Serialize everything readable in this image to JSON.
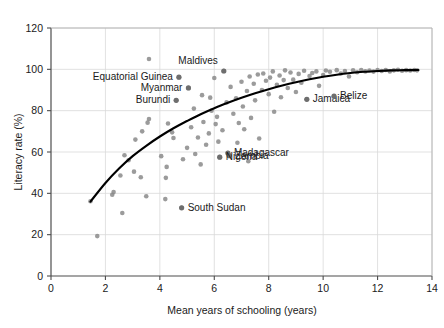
{
  "chart_data": {
    "type": "scatter",
    "title": "",
    "xlabel": "Mean years of schooling (years)",
    "ylabel": "Literacy rate (%)",
    "xlim": [
      0,
      14
    ],
    "ylim": [
      0,
      120
    ],
    "xticks": [
      0,
      2,
      4,
      6,
      8,
      10,
      12,
      14
    ],
    "yticks": [
      0,
      20,
      40,
      60,
      80,
      100,
      120
    ],
    "grid": true,
    "legend": "none",
    "marker_color": "#8a8a8a",
    "trendline_color": "#000000",
    "trendline_note": "Saturating logarithmic fit rising from ~36% at 1.5 years to ~100% at 13.5 years",
    "points": [
      {
        "x": 1.45,
        "y": 36.2
      },
      {
        "x": 1.7,
        "y": 19.3
      },
      {
        "x": 2.25,
        "y": 39.3
      },
      {
        "x": 2.3,
        "y": 40.6
      },
      {
        "x": 2.55,
        "y": 48.6
      },
      {
        "x": 2.62,
        "y": 30.5
      },
      {
        "x": 2.7,
        "y": 58.4
      },
      {
        "x": 2.85,
        "y": 56.0
      },
      {
        "x": 3.05,
        "y": 50.5
      },
      {
        "x": 3.1,
        "y": 66.0
      },
      {
        "x": 3.3,
        "y": 47.8
      },
      {
        "x": 3.35,
        "y": 70.0
      },
      {
        "x": 3.5,
        "y": 38.6
      },
      {
        "x": 3.55,
        "y": 74.2
      },
      {
        "x": 3.6,
        "y": 76.0
      },
      {
        "x": 4.05,
        "y": 58.0
      },
      {
        "x": 4.2,
        "y": 37.2
      },
      {
        "x": 4.22,
        "y": 47.5
      },
      {
        "x": 4.25,
        "y": 52.8
      },
      {
        "x": 4.3,
        "y": 73.8
      },
      {
        "x": 4.45,
        "y": 69.5
      },
      {
        "x": 4.5,
        "y": 66.8
      },
      {
        "x": 4.6,
        "y": 85.0
      },
      {
        "x": 4.7,
        "y": 96.2
      },
      {
        "x": 4.8,
        "y": 33.0
      },
      {
        "x": 4.85,
        "y": 56.5
      },
      {
        "x": 5.0,
        "y": 62.0
      },
      {
        "x": 5.05,
        "y": 91.0
      },
      {
        "x": 5.15,
        "y": 72.0
      },
      {
        "x": 5.25,
        "y": 81.0
      },
      {
        "x": 5.3,
        "y": 59.0
      },
      {
        "x": 5.4,
        "y": 67.0
      },
      {
        "x": 5.5,
        "y": 54.0
      },
      {
        "x": 5.55,
        "y": 87.5
      },
      {
        "x": 5.6,
        "y": 74.5
      },
      {
        "x": 5.7,
        "y": 63.5
      },
      {
        "x": 5.8,
        "y": 69.0
      },
      {
        "x": 5.85,
        "y": 86.3
      },
      {
        "x": 5.9,
        "y": 80.0
      },
      {
        "x": 6.0,
        "y": 95.8
      },
      {
        "x": 6.05,
        "y": 73.5
      },
      {
        "x": 6.1,
        "y": 77.0
      },
      {
        "x": 6.15,
        "y": 65.0
      },
      {
        "x": 6.2,
        "y": 57.5
      },
      {
        "x": 6.3,
        "y": 70.5
      },
      {
        "x": 6.35,
        "y": 99.2
      },
      {
        "x": 6.45,
        "y": 84.0
      },
      {
        "x": 6.5,
        "y": 59.5
      },
      {
        "x": 6.55,
        "y": 58.2
      },
      {
        "x": 6.6,
        "y": 91.5
      },
      {
        "x": 6.7,
        "y": 78.5
      },
      {
        "x": 6.8,
        "y": 86.0
      },
      {
        "x": 6.85,
        "y": 64.5
      },
      {
        "x": 6.9,
        "y": 74.0
      },
      {
        "x": 7.0,
        "y": 94.0
      },
      {
        "x": 7.05,
        "y": 82.0
      },
      {
        "x": 7.1,
        "y": 71.0
      },
      {
        "x": 7.2,
        "y": 89.5
      },
      {
        "x": 7.25,
        "y": 55.5
      },
      {
        "x": 7.3,
        "y": 96.5
      },
      {
        "x": 7.35,
        "y": 76.5
      },
      {
        "x": 7.45,
        "y": 93.0
      },
      {
        "x": 7.5,
        "y": 85.0
      },
      {
        "x": 7.6,
        "y": 97.5
      },
      {
        "x": 7.65,
        "y": 66.5
      },
      {
        "x": 7.75,
        "y": 90.0
      },
      {
        "x": 7.8,
        "y": 98.0
      },
      {
        "x": 7.9,
        "y": 94.5
      },
      {
        "x": 8.0,
        "y": 88.0
      },
      {
        "x": 8.05,
        "y": 96.0
      },
      {
        "x": 8.15,
        "y": 99.0
      },
      {
        "x": 8.2,
        "y": 79.5
      },
      {
        "x": 8.3,
        "y": 92.5
      },
      {
        "x": 8.4,
        "y": 97.0
      },
      {
        "x": 8.45,
        "y": 86.5
      },
      {
        "x": 8.55,
        "y": 94.8
      },
      {
        "x": 8.6,
        "y": 99.5
      },
      {
        "x": 8.7,
        "y": 91.0
      },
      {
        "x": 8.8,
        "y": 98.5
      },
      {
        "x": 8.9,
        "y": 95.0
      },
      {
        "x": 9.0,
        "y": 89.0
      },
      {
        "x": 9.1,
        "y": 97.8
      },
      {
        "x": 9.2,
        "y": 93.5
      },
      {
        "x": 9.3,
        "y": 99.3
      },
      {
        "x": 9.4,
        "y": 85.5
      },
      {
        "x": 9.5,
        "y": 96.8
      },
      {
        "x": 9.6,
        "y": 98.2
      },
      {
        "x": 9.75,
        "y": 99.0
      },
      {
        "x": 9.85,
        "y": 92.0
      },
      {
        "x": 10.0,
        "y": 97.2
      },
      {
        "x": 10.1,
        "y": 99.4
      },
      {
        "x": 10.25,
        "y": 98.8
      },
      {
        "x": 10.4,
        "y": 87.0
      },
      {
        "x": 10.5,
        "y": 99.6
      },
      {
        "x": 10.65,
        "y": 98.0
      },
      {
        "x": 10.8,
        "y": 99.2
      },
      {
        "x": 10.95,
        "y": 96.5
      },
      {
        "x": 11.1,
        "y": 99.5
      },
      {
        "x": 11.25,
        "y": 98.6
      },
      {
        "x": 11.4,
        "y": 99.7
      },
      {
        "x": 11.55,
        "y": 99.0
      },
      {
        "x": 11.7,
        "y": 99.4
      },
      {
        "x": 11.85,
        "y": 98.9
      },
      {
        "x": 12.0,
        "y": 99.6
      },
      {
        "x": 12.15,
        "y": 99.2
      },
      {
        "x": 12.3,
        "y": 99.7
      },
      {
        "x": 12.45,
        "y": 99.0
      },
      {
        "x": 12.6,
        "y": 99.5
      },
      {
        "x": 12.75,
        "y": 99.8
      },
      {
        "x": 12.9,
        "y": 99.3
      },
      {
        "x": 13.05,
        "y": 99.6
      },
      {
        "x": 13.2,
        "y": 99.4
      },
      {
        "x": 13.35,
        "y": 99.7
      },
      {
        "x": 13.45,
        "y": 99.5
      },
      {
        "x": 3.6,
        "y": 105.0
      }
    ],
    "annotations": [
      {
        "label": "Maldives",
        "x": 6.35,
        "y": 99.2,
        "label_dx": -6,
        "label_dy": -7,
        "anchor": "end"
      },
      {
        "label": "Equatorial Guinea",
        "x": 4.7,
        "y": 96.2,
        "label_dx": -6,
        "label_dy": 3,
        "anchor": "end"
      },
      {
        "label": "Myanmar",
        "x": 5.05,
        "y": 91.0,
        "label_dx": -6,
        "label_dy": 3,
        "anchor": "end"
      },
      {
        "label": "Burundi",
        "x": 4.6,
        "y": 85.0,
        "label_dx": -6,
        "label_dy": 3,
        "anchor": "end"
      },
      {
        "label": "Jamaica",
        "x": 9.4,
        "y": 85.5,
        "label_dx": 6,
        "label_dy": 3,
        "anchor": "start"
      },
      {
        "label": "Belize",
        "x": 10.4,
        "y": 87.0,
        "label_dx": 6,
        "label_dy": 3,
        "anchor": "start"
      },
      {
        "label": "Madagascar",
        "x": 6.5,
        "y": 59.5,
        "label_dx": 6,
        "label_dy": 3,
        "anchor": "start"
      },
      {
        "label": "Zambia",
        "x": 6.55,
        "y": 58.2,
        "label_dx": 6,
        "label_dy": 3,
        "anchor": "start"
      },
      {
        "label": "Nigeria",
        "x": 6.2,
        "y": 57.5,
        "label_dx": 6,
        "label_dy": 3,
        "anchor": "start"
      },
      {
        "label": "South Sudan",
        "x": 4.8,
        "y": 33.0,
        "label_dx": 6,
        "label_dy": 3,
        "anchor": "start"
      }
    ],
    "trendline": [
      {
        "x": 1.45,
        "y": 36.0
      },
      {
        "x": 2.0,
        "y": 45.0
      },
      {
        "x": 2.5,
        "y": 52.0
      },
      {
        "x": 3.0,
        "y": 58.0
      },
      {
        "x": 3.5,
        "y": 63.0
      },
      {
        "x": 4.0,
        "y": 67.5
      },
      {
        "x": 4.5,
        "y": 71.5
      },
      {
        "x": 5.0,
        "y": 75.0
      },
      {
        "x": 5.5,
        "y": 78.3
      },
      {
        "x": 6.0,
        "y": 81.2
      },
      {
        "x": 6.5,
        "y": 83.8
      },
      {
        "x": 7.0,
        "y": 86.2
      },
      {
        "x": 7.5,
        "y": 88.4
      },
      {
        "x": 8.0,
        "y": 90.4
      },
      {
        "x": 8.5,
        "y": 92.2
      },
      {
        "x": 9.0,
        "y": 93.8
      },
      {
        "x": 9.5,
        "y": 95.2
      },
      {
        "x": 10.0,
        "y": 96.4
      },
      {
        "x": 10.5,
        "y": 97.4
      },
      {
        "x": 11.0,
        "y": 98.2
      },
      {
        "x": 11.5,
        "y": 98.8
      },
      {
        "x": 12.0,
        "y": 99.2
      },
      {
        "x": 12.5,
        "y": 99.5
      },
      {
        "x": 13.0,
        "y": 99.6
      },
      {
        "x": 13.5,
        "y": 99.7
      }
    ]
  }
}
